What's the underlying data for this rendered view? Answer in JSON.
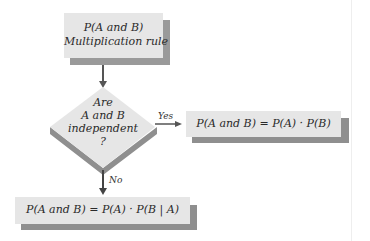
{
  "diagram": {
    "start_box": {
      "line1": "P(A and B)",
      "line2": "Multiplication rule"
    },
    "decision": {
      "line1": "Are",
      "line2": "A and B",
      "line3": "independent",
      "line4": "?"
    },
    "yes_label": "Yes",
    "no_label": "No",
    "yes_box": {
      "formula": "P(A and B) = P(A) · P(B)"
    },
    "no_box": {
      "formula": "P(A and B) = P(A) · P(B | A)"
    },
    "colors": {
      "box_fill": "#e6e6e6",
      "shadow": "#8f8f8f",
      "arrow": "#555555",
      "text": "#2a2a2a"
    }
  }
}
